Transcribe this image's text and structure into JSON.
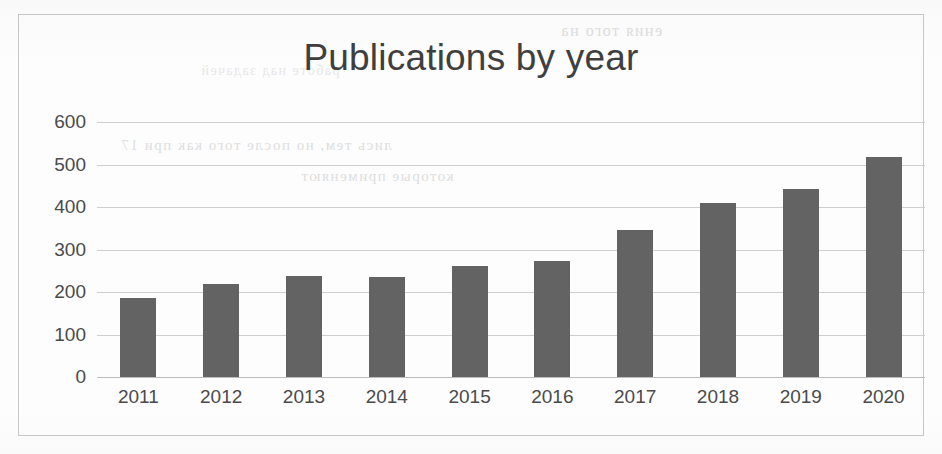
{
  "chart_data": {
    "type": "bar",
    "title": "Publications by year",
    "xlabel": "",
    "ylabel": "",
    "categories": [
      "2011",
      "2012",
      "2013",
      "2014",
      "2015",
      "2016",
      "2017",
      "2018",
      "2019",
      "2020"
    ],
    "values": [
      185,
      218,
      238,
      235,
      262,
      273,
      347,
      410,
      442,
      518
    ],
    "ylim": [
      0,
      600
    ],
    "yticks": [
      0,
      100,
      200,
      300,
      400,
      500,
      600
    ],
    "ytick_labels": [
      "0",
      "100",
      "200",
      "300",
      "400",
      "500",
      "600"
    ],
    "grid": true,
    "legend": false,
    "series": [
      {
        "name": "Publications",
        "values": [
          185,
          218,
          238,
          235,
          262,
          273,
          347,
          410,
          442,
          518
        ]
      }
    ],
    "bar_color": "#636363",
    "grid_color": "#cfcfcf",
    "text_color": "#4a4a4a",
    "frame_color": "#c8c8c8",
    "background_color": "#fdfdfd"
  },
  "page": {
    "medium": "scanned-document",
    "bleed_through_lines": [
      "ения  того  на",
      "лись  тем,  но  после  того  как  при  17",
      "которые  применяют",
      "работе  над  задачей"
    ]
  }
}
